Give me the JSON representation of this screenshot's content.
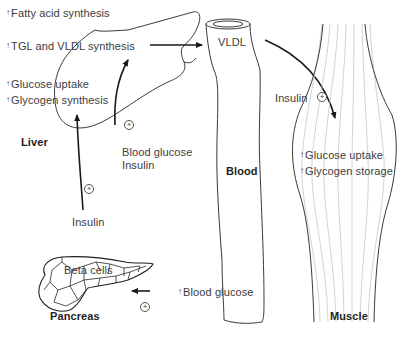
{
  "organs": {
    "liver": {
      "label": "Liver",
      "effects": [
        {
          "arrow": "↑",
          "text": "Fatty acid synthesis"
        },
        {
          "arrow": "↑",
          "text": "TGL and VLDL synthesis"
        },
        {
          "arrow": "↑",
          "text": "Glucose uptake"
        },
        {
          "arrow": "↑",
          "text": "Glycogen synthesis"
        }
      ]
    },
    "blood": {
      "label": "Blood",
      "vldl_label": "VLDL",
      "signal_label": "↑",
      "signal_text": "Blood glucose"
    },
    "muscle": {
      "label": "Muscle",
      "effects": [
        {
          "arrow": "↑",
          "text": "Glucose uptake"
        },
        {
          "arrow": "↑",
          "text": "Glycogen storage"
        }
      ]
    },
    "pancreas": {
      "label": "Pancreas",
      "cells_label": "Beta cells"
    }
  },
  "signals": {
    "liver_input": "Insulin",
    "liver_stimulus_line1": "Blood glucose",
    "liver_stimulus_line2": "Insulin",
    "muscle_input": "Insulin",
    "stimulation_symbol": "+"
  }
}
